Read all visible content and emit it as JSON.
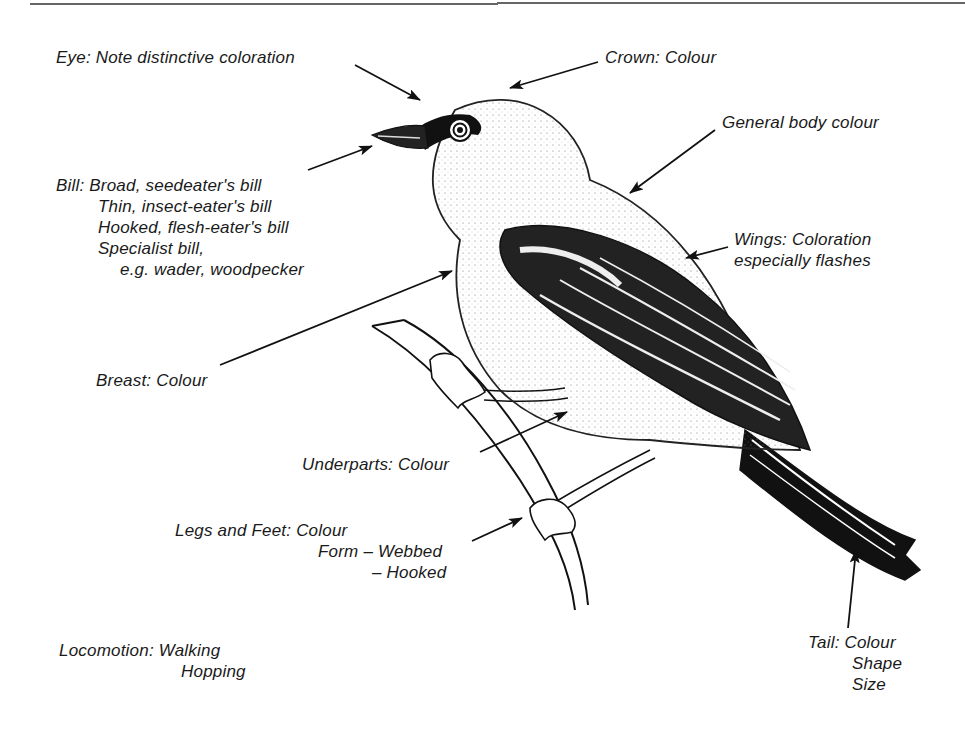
{
  "diagram": {
    "labels": {
      "eye": {
        "lines": [
          "Eye: Note distinctive coloration"
        ]
      },
      "crown": {
        "lines": [
          "Crown: Colour"
        ]
      },
      "body": {
        "lines": [
          "General body colour"
        ]
      },
      "bill": {
        "lines": [
          "Bill: Broad, seedeater's bill",
          "Thin, insect-eater's bill",
          "Hooked, flesh-eater's bill",
          "Specialist bill,",
          "e.g. wader, woodpecker"
        ]
      },
      "wings": {
        "lines": [
          "Wings: Coloration",
          "especially flashes"
        ]
      },
      "breast": {
        "lines": [
          "Breast: Colour"
        ]
      },
      "underparts": {
        "lines": [
          "Underparts: Colour"
        ]
      },
      "legs": {
        "lines": [
          "Legs and Feet: Colour",
          "Form – Webbed",
          "– Hooked"
        ]
      },
      "locomotion": {
        "lines": [
          "Locomotion: Walking",
          "Hopping"
        ]
      },
      "tail": {
        "lines": [
          "Tail: Colour",
          "Shape",
          "Size"
        ]
      }
    },
    "colors": {
      "ink": "#1a1a1a",
      "background": "#ffffff"
    }
  }
}
